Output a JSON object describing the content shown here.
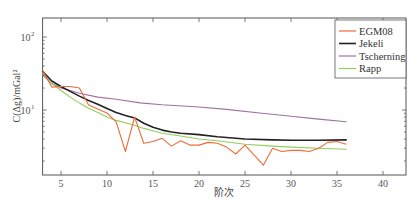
{
  "chart_data": {
    "type": "line",
    "title": "",
    "xlabel": "阶次",
    "ylabel": "C(Δg)/mGal²",
    "yscale": "log",
    "xlim": [
      3,
      42.5
    ],
    "ylim": [
      1.4,
      180
    ],
    "grid": false,
    "legend_position": "upper right",
    "x_ticks": [
      5,
      10,
      15,
      20,
      25,
      30,
      35,
      40
    ],
    "y_ticks": [
      {
        "value": 10,
        "label": "10",
        "exp": "1"
      },
      {
        "value": 100,
        "label": "10",
        "exp": "2"
      }
    ],
    "series": [
      {
        "name": "EGM08",
        "color": "#f06a3a",
        "width": 1.1,
        "x": [
          3,
          4,
          5,
          6,
          7,
          8,
          9,
          10,
          11,
          12,
          13,
          14,
          15,
          16,
          17,
          18,
          19,
          20,
          21,
          22,
          23,
          24,
          25,
          26,
          27,
          28,
          29,
          30,
          31,
          32,
          33,
          34,
          35,
          36
        ],
        "values": [
          35,
          20.6,
          21,
          21,
          20,
          11.7,
          10.3,
          9.1,
          6.9,
          2.7,
          8.0,
          3.5,
          3.7,
          4.1,
          3.2,
          3.8,
          3.3,
          3.3,
          3.6,
          3.5,
          3.1,
          2.5,
          3.3,
          2.4,
          1.76,
          3.0,
          2.7,
          2.8,
          2.8,
          2.7,
          3.0,
          3.6,
          3.7,
          3.4
        ]
      },
      {
        "name": "Jekeli",
        "color": "#222222",
        "width": 1.6,
        "x": [
          3,
          4,
          5,
          6,
          7,
          8,
          9,
          10,
          11,
          12,
          13,
          14,
          15,
          16,
          17,
          18,
          20,
          22,
          25,
          28,
          30,
          33,
          36
        ],
        "values": [
          34,
          25,
          21,
          18,
          15.5,
          13.5,
          12,
          10.5,
          9.2,
          8.4,
          7.8,
          6.6,
          5.8,
          5.3,
          5.0,
          4.8,
          4.6,
          4.3,
          4.0,
          3.9,
          3.85,
          3.85,
          3.9
        ]
      },
      {
        "name": "Tscherning",
        "color": "#a06fa8",
        "width": 1.1,
        "x": [
          3,
          4,
          5,
          6,
          7,
          9,
          11,
          13.6,
          16,
          20,
          23,
          26.6,
          30,
          33,
          36
        ],
        "values": [
          30,
          23,
          20,
          18.5,
          17,
          15,
          14,
          12.5,
          11.8,
          11,
          10.2,
          9.1,
          8.2,
          7.5,
          6.9
        ]
      },
      {
        "name": "Rapp",
        "color": "#8fcf5a",
        "width": 1.1,
        "x": [
          3,
          4,
          5,
          6,
          7,
          8,
          9,
          10,
          11,
          12,
          13,
          14,
          15,
          16,
          18,
          20,
          22,
          25,
          28,
          30,
          33,
          36
        ],
        "values": [
          32,
          23,
          18.5,
          15,
          12.5,
          10.6,
          9.2,
          8.0,
          7.2,
          6.7,
          6.2,
          5.6,
          5.2,
          4.8,
          4.4,
          4.0,
          3.8,
          3.4,
          3.2,
          3.1,
          3.0,
          2.9
        ]
      }
    ]
  },
  "legend": {
    "items": [
      {
        "label": "EGM08",
        "color": "#f06a3a"
      },
      {
        "label": "Jekeli",
        "color": "#222222"
      },
      {
        "label": "Tscherning",
        "color": "#a06fa8"
      },
      {
        "label": "Rapp",
        "color": "#8fcf5a"
      }
    ]
  }
}
